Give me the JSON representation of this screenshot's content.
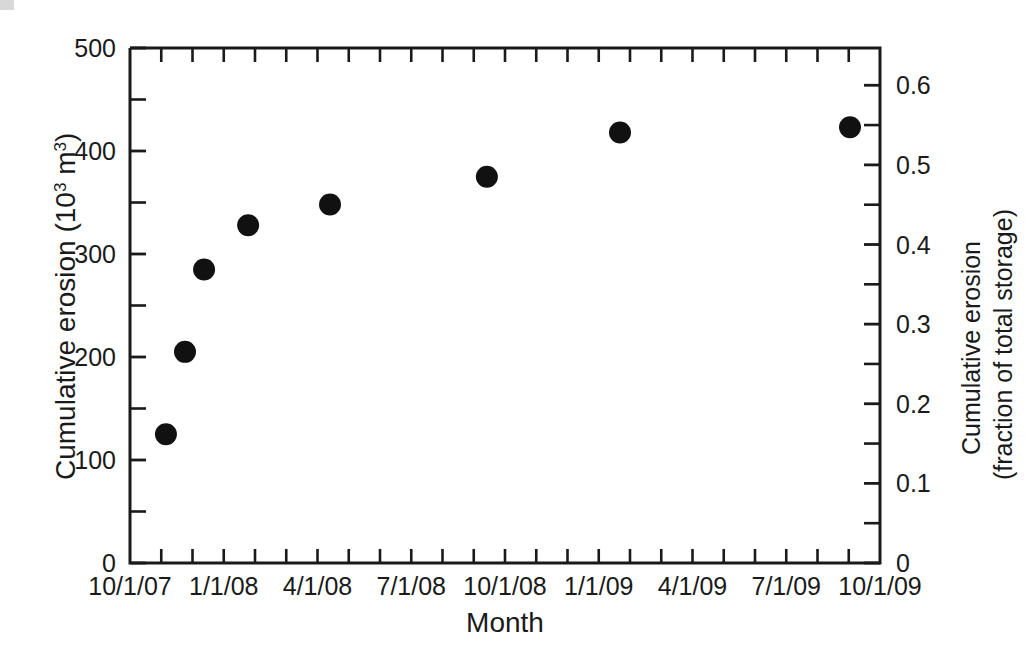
{
  "chart_data": {
    "type": "scatter",
    "title": "",
    "xlabel": "Month",
    "ylabel": "Cumulative erosion (10³ m³)",
    "y2label": "Cumulative erosion (fraction of total storage)",
    "grid": false,
    "legend": "none",
    "xlim": [
      "10/1/07",
      "10/1/09"
    ],
    "ylim": [
      0,
      500
    ],
    "y2lim": [
      0,
      0.6468
    ],
    "x_tick_labels": [
      "10/1/07",
      "1/1/08",
      "4/1/08",
      "7/1/08",
      "10/1/08",
      "1/1/09",
      "4/1/09",
      "7/1/09",
      "10/1/09"
    ],
    "x_tick_months": [
      0,
      3,
      6,
      9,
      12,
      15,
      18,
      21,
      24
    ],
    "x_minor_tick_count": 24,
    "y_tick_labels": [
      "0",
      "100",
      "200",
      "300",
      "400",
      "500"
    ],
    "y_tick_values": [
      0,
      100,
      200,
      300,
      400,
      500
    ],
    "y2_tick_labels": [
      "0",
      "0.1",
      "0.2",
      "0.3",
      "0.4",
      "0.5",
      "0.6"
    ],
    "y2_tick_values": [
      0,
      0.1,
      0.2,
      0.3,
      0.4,
      0.5,
      0.6
    ],
    "series": [
      {
        "name": "Cumulative erosion",
        "marker": "filled-circle",
        "color": "#111111",
        "points": [
          {
            "x_label": "11/1/07",
            "x_months": 1.15,
            "y": 125,
            "y2": 0.162
          },
          {
            "x_label": "12/1/07",
            "x_months": 1.76,
            "y": 205,
            "y2": 0.265
          },
          {
            "x_label": "12/20/07",
            "x_months": 2.37,
            "y": 285,
            "y2": 0.369
          },
          {
            "x_label": "2/5/08",
            "x_months": 3.78,
            "y": 328,
            "y2": 0.424
          },
          {
            "x_label": "5/15/08",
            "x_months": 6.4,
            "y": 348,
            "y2": 0.45
          },
          {
            "x_label": "9/25/08",
            "x_months": 11.42,
            "y": 375,
            "y2": 0.485
          },
          {
            "x_label": "1/25/09",
            "x_months": 15.68,
            "y": 418,
            "y2": 0.541
          },
          {
            "x_label": "9/20/09",
            "x_months": 23.04,
            "y": 423,
            "y2": 0.547
          }
        ]
      }
    ]
  },
  "figure": {
    "left_axis_title_line1": "Cumulative erosion (10",
    "left_axis_title_exp": "3",
    "left_axis_title_line2": " m",
    "left_axis_title_exp2": "3",
    "left_axis_title_close": ")",
    "right_axis_title_line1": "Cumulative erosion",
    "right_axis_title_line2": "(fraction of total storage)",
    "x_axis_title": "Month"
  }
}
